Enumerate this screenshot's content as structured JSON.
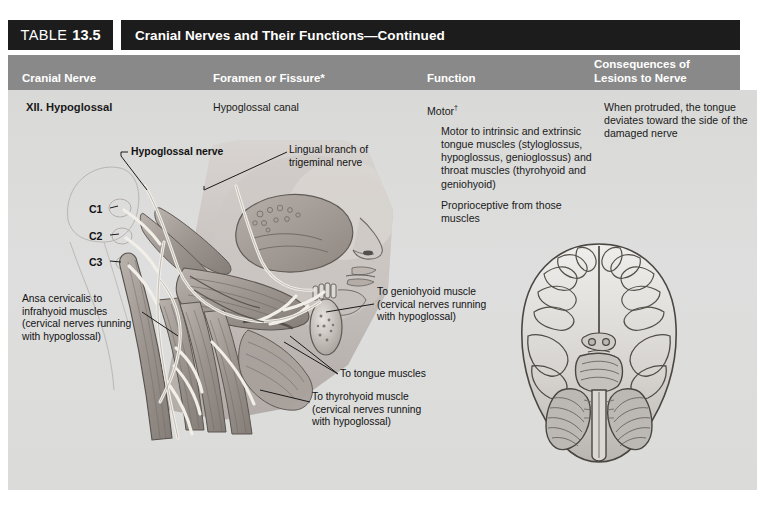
{
  "table": {
    "label_word": "TABLE",
    "number": "13.5",
    "title": "Cranial Nerves and Their Functions—Continued"
  },
  "columns": {
    "cranial_nerve": "Cranial Nerve",
    "foramen": "Foramen or Fissure*",
    "function": "Function",
    "consequences_line1": "Consequences of",
    "consequences_line2": "Lesions to Nerve"
  },
  "row": {
    "nerve": "XII. Hypoglossal",
    "foramen": "Hypoglossal canal",
    "function": {
      "heading": "Motor",
      "heading_superscript": "†",
      "paragraphs": [
        "Motor to intrinsic and extrinsic tongue muscles (styloglossus, hypoglossus, genioglossus) and throat muscles (thyrohyoid and geniohyoid)",
        "Proprioceptive from those muscles"
      ]
    },
    "consequences": "When protruded, the tongue deviates toward the side of the damaged nerve"
  },
  "figure": {
    "labels": {
      "hypoglossal_nerve": "Hypoglossal nerve",
      "lingual_branch": "Lingual branch of\ntrigeminal nerve",
      "c1": "C1",
      "c2": "C2",
      "c3": "C3",
      "ansa_cervicalis": "Ansa cervicalis to infrahyoid muscles (cervical nerves running with hypoglossal)",
      "to_geniohyoid": "To geniohyoid muscle (cervical nerves running with hypoglossal)",
      "to_tongue": "To tongue muscles",
      "to_thyrohyoid": "To thyrohyoid muscle (cervical nerves running with hypoglossal)"
    },
    "illustrations": [
      {
        "name": "head-neck-lateral-dissection",
        "view": "lateral view of head and neck showing hypoglossal nerve"
      },
      {
        "name": "brain-inferior-view",
        "view": "inferior view of brain"
      }
    ]
  },
  "colors": {
    "title_bar": "#1c1c1c",
    "column_header": "#898989",
    "panel": "#dcdcda",
    "text": "#1a1a1a",
    "header_text": "#ffffff"
  }
}
